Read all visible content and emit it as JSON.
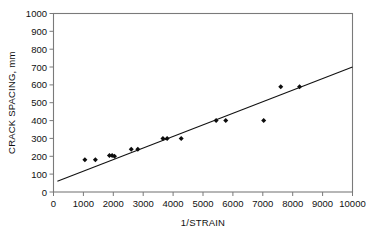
{
  "chart_data": {
    "type": "scatter",
    "title": "",
    "xlabel": "1/STRAIN",
    "ylabel": "CRACK SPACING, mm",
    "xlim": [
      0,
      10000
    ],
    "ylim": [
      0,
      1000
    ],
    "xticks": [
      0,
      1000,
      2000,
      3000,
      4000,
      5000,
      6000,
      7000,
      8000,
      9000,
      10000
    ],
    "yticks": [
      0,
      100,
      200,
      300,
      400,
      500,
      600,
      700,
      800,
      900,
      1000
    ],
    "xtick_labels": [
      "0",
      "1000",
      "2000",
      "3000",
      "4000",
      "5000",
      "6000",
      "7000",
      "8000",
      "9000",
      "10000"
    ],
    "ytick_labels": [
      "0",
      "100",
      "200",
      "300",
      "400",
      "500",
      "600",
      "700",
      "800",
      "900",
      "1000"
    ],
    "grid": false,
    "legend": null,
    "marker": "diamond",
    "marker_color": "#0d0d0d",
    "points": [
      {
        "x": 1050,
        "y": 180
      },
      {
        "x": 1400,
        "y": 180
      },
      {
        "x": 1870,
        "y": 205
      },
      {
        "x": 1960,
        "y": 205
      },
      {
        "x": 2040,
        "y": 200
      },
      {
        "x": 2600,
        "y": 240
      },
      {
        "x": 2820,
        "y": 240
      },
      {
        "x": 3660,
        "y": 300
      },
      {
        "x": 3800,
        "y": 300
      },
      {
        "x": 4270,
        "y": 300
      },
      {
        "x": 5440,
        "y": 400
      },
      {
        "x": 5760,
        "y": 400
      },
      {
        "x": 7030,
        "y": 400
      },
      {
        "x": 7600,
        "y": 590
      },
      {
        "x": 8230,
        "y": 590
      }
    ],
    "fit_line": {
      "type": "linear",
      "x_start": 130,
      "y_start": 60,
      "x_end": 10000,
      "y_end": 700,
      "slope": 0.0649,
      "intercept": 52,
      "color": "#111111"
    }
  }
}
